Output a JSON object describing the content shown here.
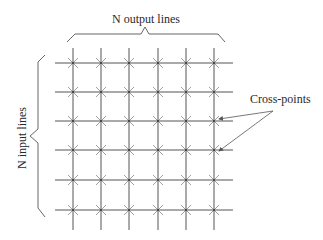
{
  "diagram": {
    "type": "crossbar-switch",
    "labels": {
      "output": "N output lines",
      "input": "N input lines",
      "crosspoints": "Cross-points"
    },
    "grid": {
      "columns": 6,
      "rows": 6,
      "column_x": [
        73,
        101,
        129,
        158,
        186,
        214
      ],
      "row_y": [
        63,
        92,
        121,
        150,
        180,
        210
      ],
      "h_line_x_start": 55,
      "h_line_x_end": 233,
      "v_line_y_start": 48,
      "v_line_y_end": 230
    },
    "arrows": [
      {
        "from": [
          273,
          111
        ],
        "to": [
          219,
          119
        ]
      },
      {
        "from": [
          273,
          111
        ],
        "to": [
          219,
          151
        ]
      }
    ],
    "colors": {
      "lines": "#555555",
      "marks": "#888888",
      "text": "#2a2a2a"
    }
  }
}
